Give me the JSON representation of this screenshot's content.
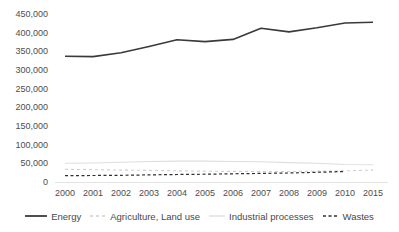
{
  "chart_data": {
    "type": "line",
    "title": "",
    "xlabel": "",
    "ylabel": "",
    "categories": [
      "2000",
      "2001",
      "2002",
      "2003",
      "2004",
      "2005",
      "2006",
      "2007",
      "2008",
      "2009",
      "2010",
      "2015"
    ],
    "series": [
      {
        "name": "Energy",
        "color": "#3a3a3a",
        "dash": null,
        "width": 1.6,
        "values": [
          337000,
          336000,
          346000,
          363000,
          381000,
          376000,
          382000,
          412000,
          402000,
          413000,
          426000,
          428000
        ]
      },
      {
        "name": "Agriculture, Land use",
        "color": "#cfcfcf",
        "dash": "3 3",
        "width": 1.1,
        "values": [
          34000,
          33000,
          32000,
          31000,
          30000,
          29000,
          28500,
          28000,
          28000,
          29000,
          30000,
          32000
        ]
      },
      {
        "name": "Industrial processes",
        "color": "#dedede",
        "dash": null,
        "width": 1.1,
        "values": [
          50000,
          51000,
          53000,
          55000,
          56000,
          56000,
          55000,
          54000,
          52000,
          50000,
          47000,
          46000
        ]
      },
      {
        "name": "Wastes",
        "color": "#2f2f2f",
        "dash": "3 2.5",
        "width": 1.2,
        "values": [
          17000,
          17500,
          18000,
          19000,
          20000,
          21000,
          22000,
          23000,
          24000,
          26000,
          28000,
          null
        ]
      }
    ],
    "ylim": [
      0,
      450000
    ],
    "ytick_step": 50000,
    "grid": false,
    "legend_position": "bottom",
    "axis_label_color": "#4d4d4d",
    "axis_line_color": "#e3e3e3"
  }
}
